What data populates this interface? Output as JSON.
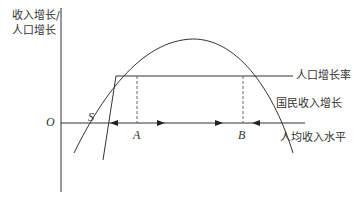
{
  "axes": {
    "y_label_line1": "收入增长/",
    "y_label_line2": "人口增长",
    "origin": "O"
  },
  "curves": {
    "population_growth": "人口增长率",
    "national_income_growth": "国民收入增长",
    "x_axis_label": "人均收入水平"
  },
  "points": {
    "s": "S",
    "a": "A",
    "b": "B"
  },
  "colors": {
    "line": "#333333",
    "dashed": "#666666"
  }
}
